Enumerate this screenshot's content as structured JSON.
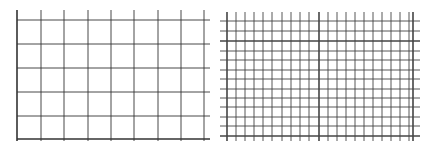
{
  "panels": [
    {
      "name": "coarse-grid",
      "vertical_lines_x": [
        17,
        41,
        64,
        88,
        111,
        134,
        158,
        181,
        204
      ],
      "horizontal_lines_y": [
        20,
        44,
        68,
        92,
        116,
        139
      ],
      "x_start": 17,
      "x_end": 210,
      "y_start": 10,
      "y_end": 141,
      "thick_vertical_x": [
        17
      ],
      "thick_horizontal_y": [
        139
      ],
      "line_color": "#333333"
    },
    {
      "name": "fine-grid",
      "vertical_lines_x": [
        227,
        236,
        245,
        254,
        263,
        272,
        282,
        291,
        300,
        309,
        319,
        328,
        337,
        346,
        355,
        364,
        373,
        382,
        391,
        400,
        409,
        413
      ],
      "horizontal_lines_y": [
        21,
        31,
        41,
        51,
        60,
        70,
        79,
        89,
        98,
        107,
        117,
        126,
        136
      ],
      "x_start": 220,
      "x_end": 420,
      "y_start": 12,
      "y_end": 141,
      "thick_vertical_x": [
        227,
        319,
        413
      ],
      "thick_horizontal_y": [
        41,
        136
      ],
      "line_color": "#444444"
    }
  ]
}
